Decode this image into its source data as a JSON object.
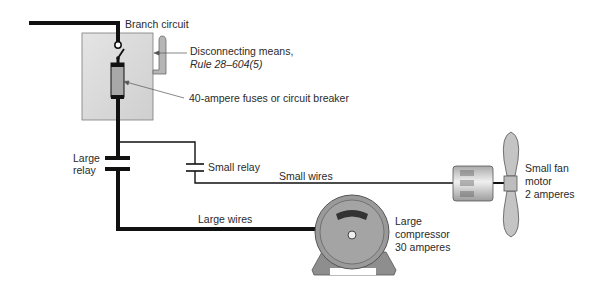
{
  "diagram": {
    "labels": {
      "branch_circuit": "Branch circuit",
      "disconnect_line1": "Disconnecting means,",
      "disconnect_line2": "Rule 28–604(5)",
      "fuses": "40-ampere fuses or circuit breaker",
      "large_relay_line1": "Large",
      "large_relay_line2": "relay",
      "small_relay": "Small relay",
      "small_wires": "Small wires",
      "large_wires": "Large wires",
      "compressor_line1": "Large",
      "compressor_line2": "compressor",
      "compressor_line3": "30 amperes",
      "fan_line1": "Small fan",
      "fan_line2": "motor",
      "fan_line3": "2 amperes"
    },
    "colors": {
      "wire": "#111111",
      "box_fill": "#d9d9d9",
      "box_stroke": "#7a7a7a",
      "fuse_fill": "#a8a8a8",
      "motor_fill": "#9a9a9a",
      "fan_fill": "#c4c4c4",
      "text": "#2a2a2a"
    }
  }
}
